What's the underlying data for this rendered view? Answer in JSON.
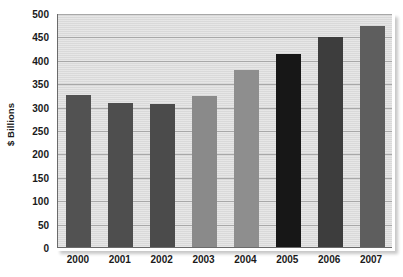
{
  "chart_data": {
    "type": "bar",
    "title": "",
    "subtitle": "",
    "xlabel": "",
    "ylabel": "$ Billions",
    "categories": [
      "2000",
      "2001",
      "2002",
      "2003",
      "2004",
      "2005",
      "2006",
      "2007"
    ],
    "values": [
      325,
      308,
      305,
      322,
      378,
      412,
      448,
      472
    ],
    "bar_colors": [
      "#525252",
      "#4e4e4e",
      "#4b4b4b",
      "#8a8a8a",
      "#8e8e8e",
      "#171717",
      "#3d3d3d",
      "#5e5e5e"
    ],
    "ylim": [
      0,
      500
    ],
    "ytick_step": 50,
    "ytick_labels": [
      "0",
      "50",
      "100",
      "150",
      "200",
      "250",
      "300",
      "350",
      "400",
      "450",
      "500"
    ],
    "ytick_values": [
      0,
      50,
      100,
      150,
      200,
      250,
      300,
      350,
      400,
      450,
      500
    ],
    "grid": true,
    "grid_axis": "y",
    "legend": false,
    "legend_position": "none",
    "plot_background": "#dcdcdc",
    "gridline_color": "#a8a8a8",
    "axis_color": "#6b6b6b",
    "text_color": "#1a1a1a",
    "annotations": []
  }
}
